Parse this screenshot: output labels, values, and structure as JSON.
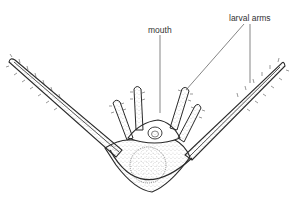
{
  "diagram": {
    "labels": {
      "mouth": "mouth",
      "larval_arms": "larval arms"
    },
    "colors": {
      "line": "#2a2a2a",
      "stipple": "#555555",
      "background": "#ffffff",
      "label_text": "#333333"
    }
  }
}
